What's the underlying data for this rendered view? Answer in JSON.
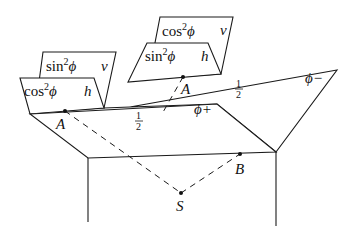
{
  "diagram": {
    "planes": {
      "phi_minus": {
        "label": "ϕ−",
        "weight": "1",
        "weight_den": "2"
      },
      "phi_plus": {
        "label": "ϕ+",
        "weight": "1",
        "weight_den": "2"
      }
    },
    "left_flaps": {
      "back": {
        "coef_fn": "sin",
        "coef_exp": "2",
        "coef_var": "ϕ",
        "pol": "v"
      },
      "front": {
        "coef_fn": "cos",
        "coef_exp": "2",
        "coef_var": "ϕ",
        "pol": "h"
      }
    },
    "right_flaps": {
      "back": {
        "coef_fn": "cos",
        "coef_exp": "2",
        "coef_var": "ϕ",
        "pol": "v"
      },
      "front": {
        "coef_fn": "sin",
        "coef_exp": "2",
        "coef_var": "ϕ",
        "pol": "h"
      }
    },
    "points": {
      "A_lower": "A",
      "A_upper": "A",
      "B": "B",
      "S": "S"
    },
    "colors": {
      "line": "#1a1a1a",
      "background": "#ffffff"
    }
  }
}
